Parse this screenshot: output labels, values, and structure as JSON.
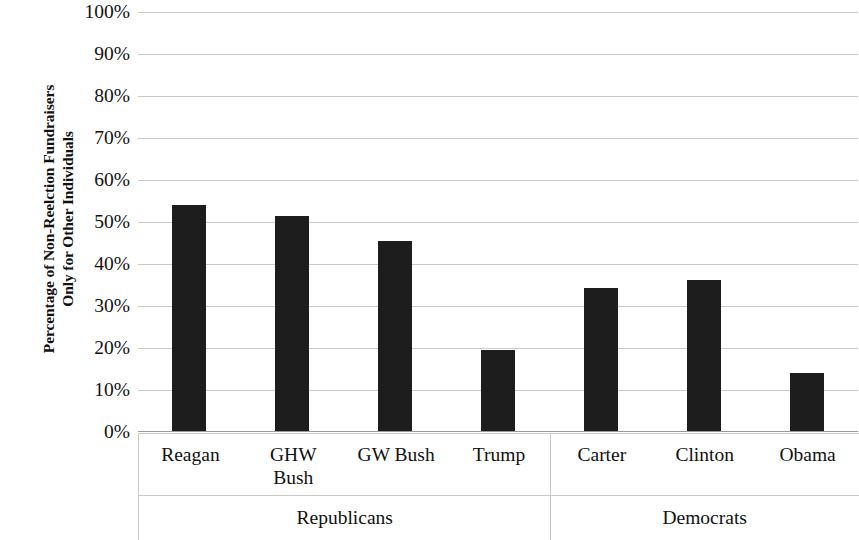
{
  "chart": {
    "type": "bar",
    "y_axis_title_line1": "Percentage of Non-Reelction Fundraisers",
    "y_axis_title_line2": "Only for Other Individuals",
    "y_ticks": [
      "100%",
      "90%",
      "80%",
      "70%",
      "60%",
      "50%",
      "40%",
      "30%",
      "20%",
      "10%",
      "0%"
    ],
    "bar_color": "#1d1d1d",
    "gridline_color": "#c9c9c9"
  },
  "categories": [
    {
      "label": "Reagan",
      "label_line2": "",
      "value": 54.0
    },
    {
      "label": "GHW",
      "label_line2": "Bush",
      "value": 51.5
    },
    {
      "label": "GW Bush",
      "label_line2": "",
      "value": 45.5
    },
    {
      "label": "Trump",
      "label_line2": "",
      "value": 19.5
    },
    {
      "label": "Carter",
      "label_line2": "",
      "value": 34.3
    },
    {
      "label": "Clinton",
      "label_line2": "",
      "value": 36.2
    },
    {
      "label": "Obama",
      "label_line2": "",
      "value": 14.0
    }
  ],
  "groups": [
    {
      "label": "Republicans"
    },
    {
      "label": "Democrats"
    }
  ],
  "chart_data": {
    "type": "bar",
    "title": "",
    "subtitle": "",
    "xlabel": "",
    "ylabel": "Percentage of Non-Reelction Fundraisers Only for Other Individuals",
    "categories": [
      "Reagan",
      "GHW Bush",
      "GW Bush",
      "Trump",
      "Carter",
      "Clinton",
      "Obama"
    ],
    "values": [
      54.0,
      51.5,
      45.5,
      19.5,
      34.3,
      36.2,
      14.0
    ],
    "groups": [
      {
        "name": "Republicans",
        "categories": [
          "Reagan",
          "GHW Bush",
          "GW Bush",
          "Trump"
        ],
        "values": [
          54.0,
          51.5,
          45.5,
          19.5
        ]
      },
      {
        "name": "Democrats",
        "categories": [
          "Carter",
          "Clinton",
          "Obama"
        ],
        "values": [
          34.3,
          36.2,
          14.0
        ]
      }
    ],
    "ylim": [
      0,
      100
    ],
    "ytick_labels": [
      "0%",
      "10%",
      "20%",
      "30%",
      "40%",
      "50%",
      "60%",
      "70%",
      "80%",
      "90%",
      "100%"
    ],
    "ytick_values": [
      0,
      10,
      20,
      30,
      40,
      50,
      60,
      70,
      80,
      90,
      100
    ],
    "grid": "horizontal",
    "legend": "none",
    "series_color": "#1d1d1d"
  }
}
